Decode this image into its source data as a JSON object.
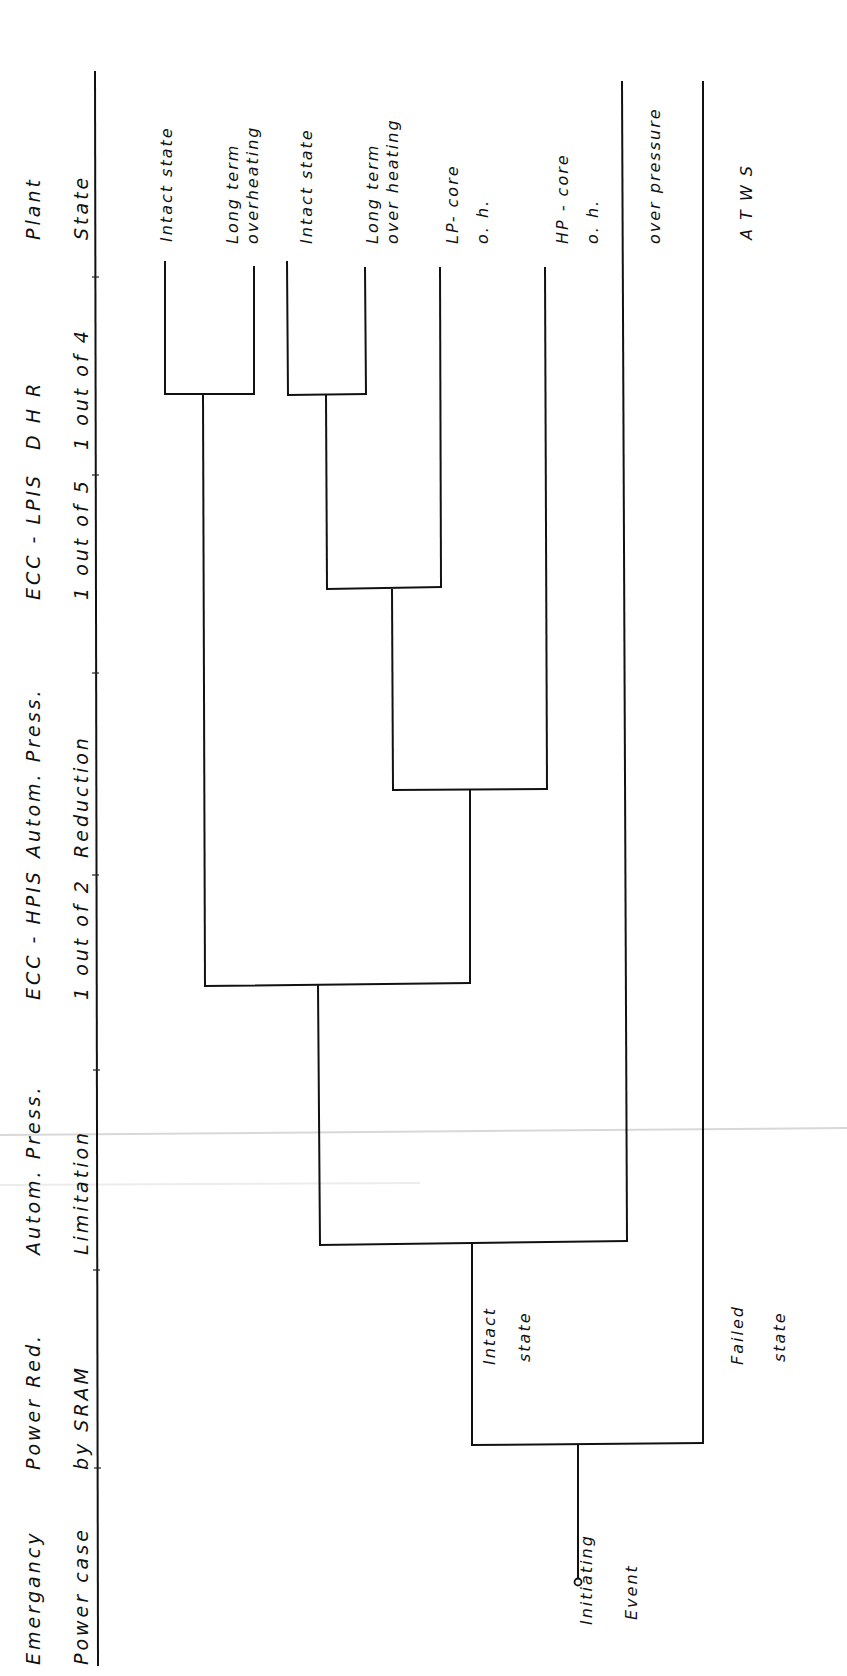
{
  "diagram": {
    "type": "event-tree",
    "orientation": "rotated-90-ccw",
    "columns": [
      {
        "line1": "Emergancy",
        "line2": "Power case"
      },
      {
        "line1": "Power Red.",
        "line2": "by SRAM"
      },
      {
        "line1": "Autom. Press.",
        "line2": "Limitation"
      },
      {
        "line1": "ECC - HPIS",
        "line2": "1 out of 2"
      },
      {
        "line1": "Autom. Press.",
        "line2": "Reduction"
      },
      {
        "line1": "ECC - LPIS",
        "line2": "1 out of 5"
      },
      {
        "line1": "D H R",
        "line2": "1 out of 4"
      },
      {
        "line1": "Plant",
        "line2": "State"
      }
    ],
    "initiating_event": {
      "line1": "Initiating",
      "line2": "Event"
    },
    "branch_labels": {
      "intact": {
        "line1": "Intact",
        "line2": "state"
      },
      "failed": {
        "line1": "Failed",
        "line2": "state"
      }
    },
    "end_states": [
      {
        "line1": "Intact state",
        "line2": ""
      },
      {
        "line1": "Long term",
        "line2": "overheating"
      },
      {
        "line1": "Intact state",
        "line2": ""
      },
      {
        "line1": "Long term",
        "line2": "over heating"
      },
      {
        "line1": "LP- core",
        "line2": "o. h."
      },
      {
        "line1": "HP - core",
        "line2": "o. h."
      },
      {
        "line1": "over pressure",
        "line2": ""
      },
      {
        "line1": "A T W S",
        "line2": ""
      }
    ]
  }
}
